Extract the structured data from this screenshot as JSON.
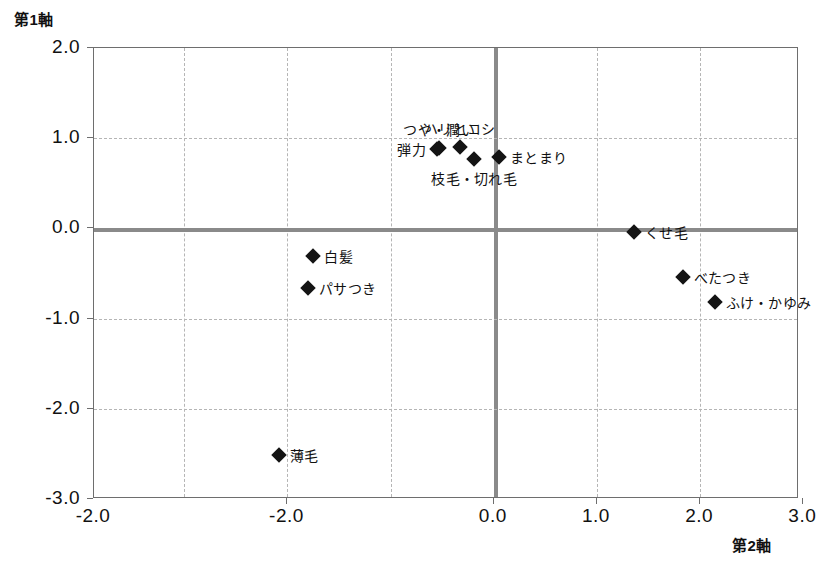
{
  "chart_data": {
    "type": "scatter",
    "title": "",
    "xlabel": "第2軸",
    "ylabel": "第1軸",
    "xlim": [
      -3.875,
      2.958
    ],
    "ylim": [
      -3.0,
      2.0
    ],
    "xticks": [
      -2.0,
      -2.0,
      0.0,
      1.0,
      2.0,
      3.0
    ],
    "xticklabels": [
      "-2.0",
      "-2.0",
      "0.0",
      "1.0",
      "2.0",
      "3.0"
    ],
    "yticks": [
      2.0,
      1.0,
      0.0,
      -1.0,
      -2.0,
      -3.0
    ],
    "yticklabels": [
      "2.0",
      "1.0",
      "0.0",
      "-1.0",
      "-2.0",
      "-3.0"
    ],
    "grid": true,
    "grid_style": "dashed",
    "legend": "none",
    "points": [
      {
        "label": "つや・潤い",
        "x": -0.53,
        "y": 0.89,
        "label_pos": "above"
      },
      {
        "label": "ハリとコシ",
        "x": -0.33,
        "y": 0.9,
        "label_pos": "above"
      },
      {
        "label": "弾力",
        "x": -0.55,
        "y": 0.88,
        "label_pos": "left"
      },
      {
        "label": "まとまり",
        "x": 0.05,
        "y": 0.79,
        "label_pos": "right"
      },
      {
        "label": "枝毛・切れ毛",
        "x": -0.19,
        "y": 0.77,
        "label_pos": "below"
      },
      {
        "label": "くせ毛",
        "x": 1.36,
        "y": -0.04,
        "label_pos": "right"
      },
      {
        "label": "白髪",
        "x": -1.75,
        "y": -0.31,
        "label_pos": "right"
      },
      {
        "label": "パサつき",
        "x": -1.8,
        "y": -0.66,
        "label_pos": "right"
      },
      {
        "label": "べたつき",
        "x": 1.83,
        "y": -0.54,
        "label_pos": "right"
      },
      {
        "label": "ふけ・かゆみ",
        "x": 2.14,
        "y": -0.82,
        "label_pos": "right"
      },
      {
        "label": "薄毛",
        "x": -2.08,
        "y": -2.51,
        "label_pos": "right"
      }
    ]
  }
}
